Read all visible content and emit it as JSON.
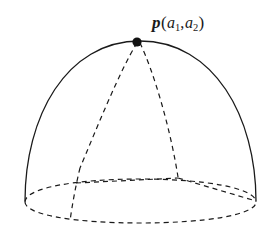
{
  "figure": {
    "kind": "diagram",
    "canvas": {
      "width": 280,
      "height": 238,
      "background": "#ffffff"
    },
    "style": {
      "stroke_color": "#1a1a1a",
      "solid_stroke_width": 1.3,
      "dashed_stroke_width": 1.2,
      "dash_pattern": "5 4",
      "dot_color": "#111111",
      "dot_radius": 4.6
    },
    "label": {
      "name": "point-label",
      "vector_symbol": "p",
      "open_paren": "(",
      "arg1_base": "a",
      "arg1_sub": "1",
      "separator": ",",
      "arg2_base": "a",
      "arg2_sub": "2",
      "close_paren": ")",
      "full_text": "p(a1,a2)",
      "x": 152,
      "y": 14
    },
    "marked_point": {
      "name": "point-p",
      "x": 137,
      "y": 42
    },
    "geometry": {
      "dome_arc": {
        "name": "dome-silhouette-arc",
        "style": "solid",
        "path": "M 25 201 C 25 117, 66 41, 140 41 C 214 41, 256 117, 256 201"
      },
      "base_ellipse_back": {
        "name": "base-ellipse-back-arc",
        "style": "dashed",
        "path": "M 25 202 C 25 188, 76 179, 140 179 C 204 179, 256 188, 256 202"
      },
      "base_ellipse_front": {
        "name": "base-ellipse-front-arc",
        "style": "dashed",
        "path": "M 25 202 C 25 215, 76 223, 140 223 C 204 223, 256 215, 256 202"
      },
      "meridian_left": {
        "name": "meridian-left-dashed",
        "style": "dashed",
        "path": "M 137 43 C 120 70, 96 130, 80 168"
      },
      "meridian_left_lower": {
        "name": "meridian-left-lower-dashed",
        "style": "dashed",
        "path": "M 80 168 C 76 184, 72 206, 70 221"
      },
      "meridian_right": {
        "name": "meridian-right-dashed",
        "style": "dashed",
        "path": "M 140 43 C 153 70, 170 126, 178 177"
      },
      "chord_horizontal": {
        "name": "patch-chord-dashed",
        "style": "dashed",
        "path": "M 76 183 L 178 178"
      },
      "chord_horizontal_right": {
        "name": "patch-chord-right-dashed",
        "style": "dashed",
        "path": "M 178 178 L 256 201"
      }
    }
  }
}
